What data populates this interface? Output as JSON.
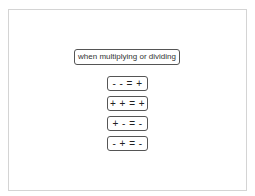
{
  "diagram": {
    "title": "when multiplying or dividing",
    "rules": [
      {
        "text": "- - = +"
      },
      {
        "text": "+ + = +"
      },
      {
        "text": "+ - = -"
      },
      {
        "text": "- + = -"
      }
    ]
  }
}
